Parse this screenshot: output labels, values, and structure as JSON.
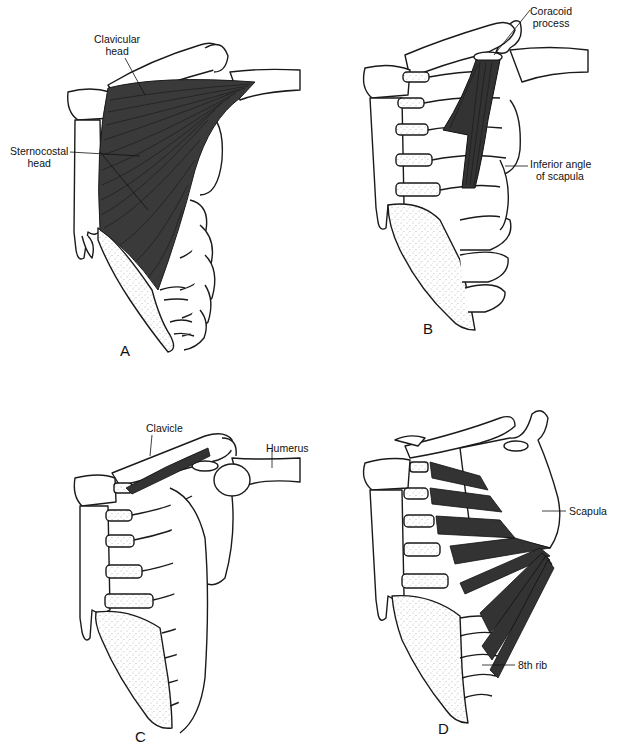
{
  "figure": {
    "panels": [
      {
        "letter": "A",
        "muscle": "pectoralis major",
        "labels": {
          "clavicular_head_1": "Clavicular",
          "clavicular_head_2": "head",
          "sternocostal_head_1": "Sternocostal",
          "sternocostal_head_2": "head"
        }
      },
      {
        "letter": "B",
        "muscle": "pectoralis minor",
        "labels": {
          "coracoid_1": "Coracoid",
          "coracoid_2": "process",
          "inferior_angle_1": "Inferior angle",
          "inferior_angle_2": "of scapula"
        }
      },
      {
        "letter": "C",
        "muscle": "subclavius",
        "labels": {
          "clavicle": "Clavicle",
          "humerus": "Humerus"
        }
      },
      {
        "letter": "D",
        "muscle": "serratus anterior",
        "labels": {
          "scapula": "Scapula",
          "eighth_rib": "8th rib"
        }
      }
    ],
    "colors": {
      "line": "#1a1a1a",
      "muscle": "#3a3a3a",
      "cartilage_stipple": "#9a9a9a",
      "background": "#ffffff"
    }
  }
}
